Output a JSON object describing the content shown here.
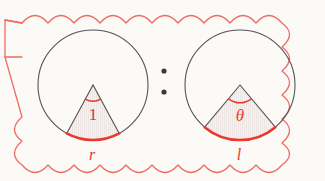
{
  "figure": {
    "background_color": "#fbfaf7",
    "accent_color": "#e8392e",
    "outline_color": "#555358",
    "border": {
      "name": "scalloped-cloud-border",
      "color": "#ef6a62",
      "style": "scalloped"
    },
    "separator": {
      "name": "ratio-colon",
      "symbol": ":",
      "dot_color": "#3a3a3a"
    },
    "panels": [
      {
        "id": "left",
        "circle": {
          "cx": 93,
          "cy": 85,
          "r": 55
        },
        "sector": {
          "angle_label": "1",
          "angle_label_style": "upright",
          "angle_degrees": 57,
          "arc_label": "r",
          "fill": "#f3efee",
          "hatch": true
        }
      },
      {
        "id": "right",
        "circle": {
          "cx": 240,
          "cy": 85,
          "r": 55
        },
        "sector": {
          "angle_label": "θ",
          "angle_label_style": "italic",
          "angle_degrees": 80,
          "arc_label": "l",
          "fill": "#f3efee",
          "hatch": true
        }
      }
    ]
  }
}
